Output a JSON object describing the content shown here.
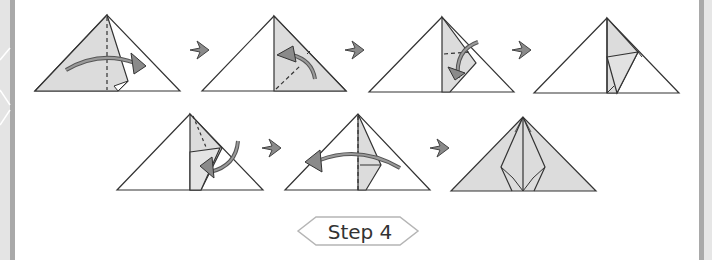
{
  "diagram": {
    "type": "origami-instruction",
    "rows": [
      {
        "frames": [
          {
            "id": 1,
            "action": "fold right flap over to right along vertical center crease",
            "arrow": "fold-right"
          },
          {
            "id": 2,
            "action": "fold corner up along diagonal dashed line",
            "arrow": "fold-up-left"
          },
          {
            "id": 3,
            "action": "fold top down along horizontal dashed line",
            "arrow": "fold-down"
          },
          {
            "id": 4,
            "action": "result with folded flap"
          }
        ]
      },
      {
        "frames": [
          {
            "id": 5,
            "action": "fold along dashed line inward",
            "arrow": "fold-down-left"
          },
          {
            "id": 6,
            "action": "fold flap back to left along center crease",
            "arrow": "fold-left"
          },
          {
            "id": 7,
            "action": "finished shape, both sides folded"
          }
        ]
      }
    ],
    "connector": "right-arrow",
    "colors": {
      "fill": "#dcdcdc",
      "stroke": "#333333",
      "arrow": "#7a7a7a",
      "badge_border": "#b5b5b5"
    }
  },
  "step_badge": {
    "label": "Step 4"
  }
}
